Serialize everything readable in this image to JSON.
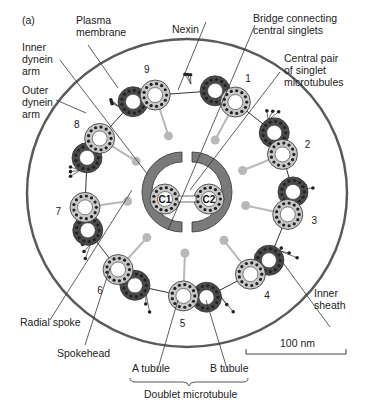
{
  "figure": {
    "panel_label": "(a)"
  },
  "labels": {
    "plasma_membrane": "Plasma\nmembrane",
    "nexin": "Nexin",
    "bridge": "Bridge connecting\ncentral singlets",
    "central_pair": "Central pair\nof singlet\nmicrotubules",
    "inner_dynein": "Inner\ndynein\narm",
    "outer_dynein": "Outer\ndynein\narm",
    "inner_sheath": "Inner\nsheath",
    "radial_spoke": "Radial spoke",
    "spokehead": "Spokehead",
    "a_tubule": "A tubule",
    "b_tubule": "B tubule",
    "doublet": "Doublet microtubule",
    "c1": "C1",
    "c2": "C2"
  },
  "doublet_numbers": [
    "1",
    "2",
    "3",
    "4",
    "5",
    "6",
    "7",
    "8",
    "9"
  ],
  "scale_bar": {
    "label": "100 nm"
  },
  "colors": {
    "membrane": "#555555",
    "a_tubule_fill": "#c8c8c8",
    "b_tubule_fill": "#4a4a4a",
    "dot": "#222222",
    "spoke": "#b8b8b8",
    "sheath": "#7a7a7a"
  }
}
